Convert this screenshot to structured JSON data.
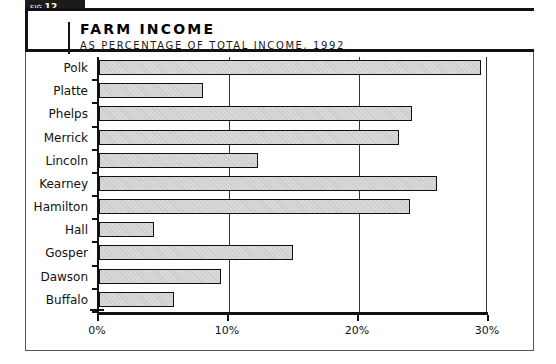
{
  "figure": {
    "tab_prefix": "FIG.",
    "tab_number": "12.",
    "title": "FARM INCOME",
    "subtitle": "AS PERCENTAGE OF TOTAL INCOME, 1992"
  },
  "colors": {
    "bar_fill": "#d9d9d9",
    "bar_border": "#111111",
    "axis": "#111111",
    "tab_background": "#1b1b1b",
    "tab_text": "#ffffff"
  },
  "chart_data": {
    "type": "bar",
    "orientation": "horizontal",
    "title": "FARM INCOME",
    "subtitle": "AS PERCENTAGE OF TOTAL INCOME, 1992",
    "xlabel": "",
    "ylabel": "",
    "categories": [
      "Polk",
      "Platte",
      "Phelps",
      "Merrick",
      "Lincoln",
      "Kearney",
      "Hamilton",
      "Hall",
      "Gosper",
      "Dawson",
      "Buffalo"
    ],
    "values": [
      29.4,
      8.0,
      24.1,
      23.1,
      12.2,
      26.0,
      23.9,
      4.2,
      14.9,
      9.4,
      5.8
    ],
    "xlim": [
      0,
      30
    ],
    "xticks": [
      0,
      10,
      20,
      30
    ],
    "xticklabels": [
      "0%",
      "10%",
      "20%",
      "30%"
    ],
    "grid": true,
    "legend": null
  }
}
